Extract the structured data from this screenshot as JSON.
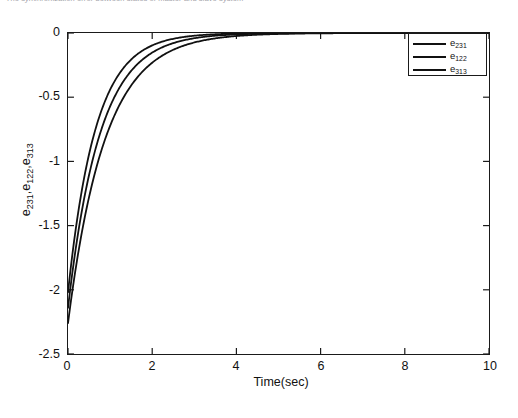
{
  "caption": {
    "text": "The synchronization error between states of master and slave system"
  },
  "figure": {
    "x_axis_title": "Time(sec)",
    "y_axis_title_parts": [
      "e",
      "231",
      ",e",
      "122",
      ",e",
      "313"
    ],
    "y_axis_title_plain": "e231,e122,e313"
  },
  "legend": {
    "position": "top-right",
    "entries": [
      {
        "base": "e",
        "sub": "231",
        "label": "e231",
        "color": "#111111"
      },
      {
        "base": "e",
        "sub": "122",
        "label": "e122",
        "color": "#111111"
      },
      {
        "base": "e",
        "sub": "313",
        "label": "e313",
        "color": "#111111"
      }
    ]
  },
  "chart_data": {
    "type": "line",
    "title": "",
    "subtitle": "",
    "xlabel": "Time(sec)",
    "ylabel": "e231,e122,e313",
    "xlim": [
      0,
      10
    ],
    "ylim": [
      -2.5,
      0
    ],
    "xticks": [
      0,
      2,
      4,
      6,
      8,
      10
    ],
    "xtick_labels": [
      "0",
      "2",
      "4",
      "6",
      "8",
      "10"
    ],
    "yticks": [
      0,
      -0.5,
      -1,
      -1.5,
      -2,
      -2.5
    ],
    "ytick_labels": [
      "0",
      "-0.5",
      "-1",
      "-1.5",
      "-2",
      "-2.5"
    ],
    "grid": false,
    "legend_position": "upper right",
    "line_color": "#111111",
    "line_width": 1.8,
    "series": [
      {
        "name": "e231",
        "y0": -2.02,
        "decay": 1.52,
        "x": [
          0,
          0.1,
          0.2,
          0.3,
          0.4,
          0.5,
          0.6,
          0.7,
          0.8,
          0.9,
          1.0,
          1.2,
          1.4,
          1.6,
          1.8,
          2.0,
          2.25,
          2.5,
          2.75,
          3.0,
          3.5,
          4.0,
          4.5,
          5.0,
          6.0,
          7.0,
          8.0,
          9.0,
          10.0
        ],
        "values": [
          -2.02,
          -1.74,
          -1.49,
          -1.28,
          -1.1,
          -0.95,
          -0.81,
          -0.7,
          -0.6,
          -0.52,
          -0.44,
          -0.33,
          -0.24,
          -0.18,
          -0.13,
          -0.1,
          -0.07,
          -0.05,
          -0.03,
          -0.02,
          -0.01,
          -0.005,
          -0.002,
          -0.001,
          0.0,
          0.0,
          0.0,
          0.0,
          0.0
        ]
      },
      {
        "name": "e122",
        "y0": -2.14,
        "decay": 1.32,
        "x": [
          0,
          0.1,
          0.2,
          0.3,
          0.4,
          0.5,
          0.6,
          0.7,
          0.8,
          0.9,
          1.0,
          1.2,
          1.4,
          1.6,
          1.8,
          2.0,
          2.25,
          2.5,
          2.75,
          3.0,
          3.5,
          4.0,
          4.5,
          5.0,
          6.0,
          7.0,
          8.0,
          9.0,
          10.0
        ],
        "values": [
          -2.14,
          -1.88,
          -1.64,
          -1.44,
          -1.26,
          -1.1,
          -0.97,
          -0.85,
          -0.74,
          -0.65,
          -0.57,
          -0.44,
          -0.34,
          -0.26,
          -0.2,
          -0.15,
          -0.11,
          -0.08,
          -0.06,
          -0.04,
          -0.02,
          -0.01,
          -0.005,
          -0.003,
          -0.001,
          0.0,
          0.0,
          0.0,
          0.0
        ]
      },
      {
        "name": "e313",
        "y0": -2.26,
        "decay": 1.14,
        "x": [
          0,
          0.1,
          0.2,
          0.3,
          0.4,
          0.5,
          0.6,
          0.7,
          0.8,
          0.9,
          1.0,
          1.2,
          1.4,
          1.6,
          1.8,
          2.0,
          2.25,
          2.5,
          2.75,
          3.0,
          3.5,
          4.0,
          4.5,
          5.0,
          6.0,
          7.0,
          8.0,
          9.0,
          10.0
        ],
        "values": [
          -2.26,
          -2.02,
          -1.8,
          -1.61,
          -1.43,
          -1.28,
          -1.14,
          -1.02,
          -0.91,
          -0.81,
          -0.72,
          -0.58,
          -0.46,
          -0.37,
          -0.29,
          -0.23,
          -0.17,
          -0.13,
          -0.1,
          -0.07,
          -0.04,
          -0.02,
          -0.013,
          -0.007,
          -0.002,
          -0.001,
          0.0,
          0.0,
          0.0
        ]
      }
    ]
  }
}
